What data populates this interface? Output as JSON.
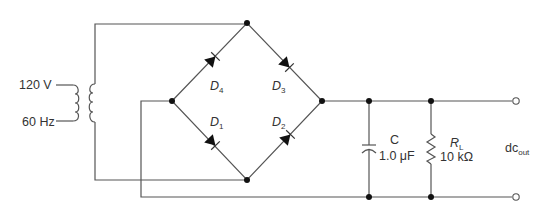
{
  "diagram": {
    "type": "full-wave bridge rectifier with capacitor filter",
    "source": {
      "voltage_label": "120 V",
      "frequency_label": "60 Hz"
    },
    "diodes": [
      {
        "id": "D1",
        "letter": "D",
        "sub": "1"
      },
      {
        "id": "D2",
        "letter": "D",
        "sub": "2"
      },
      {
        "id": "D3",
        "letter": "D",
        "sub": "3"
      },
      {
        "id": "D4",
        "letter": "D",
        "sub": "4"
      }
    ],
    "capacitor": {
      "name": "C",
      "value": "1.0 μF"
    },
    "resistor": {
      "letter": "R",
      "sub": "L",
      "value": "10 kΩ"
    },
    "output": {
      "main": "dc",
      "sub": "out"
    },
    "colors": {
      "wire": "#555555",
      "node": "#111111",
      "text": "#333333"
    }
  }
}
